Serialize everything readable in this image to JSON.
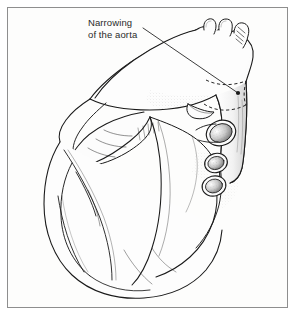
{
  "figure": {
    "kind": "anatomical-line-illustration",
    "background_color": "#fdfdfc",
    "ink_color": "#1a1a1a",
    "frame_color": "#8e8e8e"
  },
  "annotation": {
    "label_line_1": "Narrowing",
    "label_line_2": "of the aorta",
    "text_color": "#2a2a2a",
    "leader_start_x": 143,
    "leader_start_y": 28,
    "leader_end_x": 238,
    "leader_end_y": 93,
    "marker_radius": 2.1
  },
  "structures": [
    {
      "name": "aortic-arch",
      "label": "aortic arch"
    },
    {
      "name": "brachiocephalic-trunk",
      "label": "brachiocephalic trunk"
    },
    {
      "name": "left-common-carotid-artery",
      "label": "left common carotid artery"
    },
    {
      "name": "left-subclavian-artery",
      "label": "left subclavian artery"
    },
    {
      "name": "descending-aorta",
      "label": "descending aorta"
    },
    {
      "name": "coarctation-segment",
      "label": "narrowed aortic segment"
    },
    {
      "name": "pulmonary-trunk",
      "label": "pulmonary trunk"
    },
    {
      "name": "left-atrial-appendage",
      "label": "left atrial appendage"
    },
    {
      "name": "right-atrium",
      "label": "right atrium"
    },
    {
      "name": "left-ventricle",
      "label": "left ventricle"
    },
    {
      "name": "right-ventricle",
      "label": "right ventricle"
    },
    {
      "name": "cut-vessel-opening-superior",
      "label": "cut vessel opening (superior)"
    },
    {
      "name": "cut-vessel-opening-middle",
      "label": "cut vessel opening (middle)"
    },
    {
      "name": "cut-vessel-opening-inferior",
      "label": "cut vessel opening (inferior)"
    },
    {
      "name": "coronary-vessels",
      "label": "coronary vessels"
    }
  ]
}
